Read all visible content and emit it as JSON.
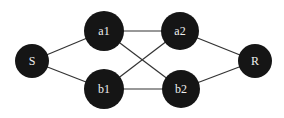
{
  "diagram": {
    "type": "graph",
    "nodes": [
      {
        "id": "S",
        "label": "S",
        "x": 32,
        "y": 61,
        "r": 17
      },
      {
        "id": "a1",
        "label": "a1",
        "x": 104,
        "y": 31,
        "r": 20
      },
      {
        "id": "b1",
        "label": "b1",
        "x": 104,
        "y": 89,
        "r": 20
      },
      {
        "id": "a2",
        "label": "a2",
        "x": 180,
        "y": 31,
        "r": 19
      },
      {
        "id": "b2",
        "label": "b2",
        "x": 181,
        "y": 89,
        "r": 19
      },
      {
        "id": "R",
        "label": "R",
        "x": 255,
        "y": 61,
        "r": 17
      }
    ],
    "edges": [
      [
        "S",
        "a1"
      ],
      [
        "S",
        "b1"
      ],
      [
        "a1",
        "a2"
      ],
      [
        "b1",
        "b2"
      ],
      [
        "a1",
        "b2"
      ],
      [
        "b1",
        "a2"
      ],
      [
        "a2",
        "R"
      ],
      [
        "b2",
        "R"
      ]
    ]
  }
}
